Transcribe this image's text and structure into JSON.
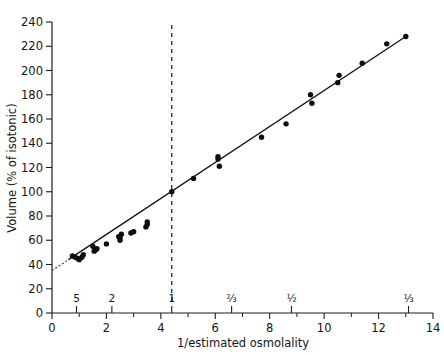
{
  "chart_data": {
    "type": "scatter",
    "title": "",
    "xlabel": "1/estimated osmolality",
    "ylabel": "Volume (% of isotonic)",
    "xlim": [
      0,
      14
    ],
    "ylim": [
      0,
      240
    ],
    "grid": false,
    "legend": null,
    "x_ticks": [
      0,
      2,
      4,
      6,
      8,
      10,
      12,
      14
    ],
    "x_tick_labels": [
      "0",
      "2",
      "4",
      "6",
      "8",
      "10",
      "12",
      "14"
    ],
    "x_minor_ticks": [
      1,
      3,
      5,
      7,
      9,
      11,
      13
    ],
    "y_ticks": [
      0,
      20,
      40,
      60,
      80,
      100,
      120,
      140,
      160,
      180,
      200,
      220,
      240
    ],
    "y_tick_labels": [
      "0",
      "20",
      "40",
      "60",
      "80",
      "100",
      "120",
      "140",
      "160",
      "180",
      "200",
      "220",
      "240"
    ],
    "secondary_axis": {
      "name": "estimated-osmolality",
      "position": "above-x-axis",
      "ticks": [
        0.9,
        2.2,
        4.4,
        6.6,
        8.8,
        13.1
      ],
      "labels": [
        "5",
        "2",
        "1",
        "⅔",
        "½",
        "⅓"
      ]
    },
    "series": [
      {
        "name": "cell volume measurements",
        "type": "scatter",
        "marker": "filled-circle",
        "color": "#0d0d0d",
        "points": [
          [
            0.75,
            47
          ],
          [
            0.85,
            46
          ],
          [
            0.95,
            45
          ],
          [
            1.0,
            44
          ],
          [
            1.1,
            46
          ],
          [
            1.15,
            48
          ],
          [
            1.5,
            55
          ],
          [
            1.55,
            51
          ],
          [
            1.6,
            52
          ],
          [
            1.65,
            53
          ],
          [
            2.0,
            57
          ],
          [
            2.45,
            63
          ],
          [
            2.5,
            62
          ],
          [
            2.5,
            60
          ],
          [
            2.55,
            65
          ],
          [
            2.9,
            66
          ],
          [
            3.0,
            67
          ],
          [
            3.45,
            71
          ],
          [
            3.5,
            73
          ],
          [
            3.5,
            75
          ],
          [
            4.4,
            100
          ],
          [
            5.2,
            111
          ],
          [
            6.1,
            127
          ],
          [
            6.1,
            129
          ],
          [
            6.15,
            121
          ],
          [
            7.7,
            145
          ],
          [
            8.6,
            156
          ],
          [
            9.5,
            180
          ],
          [
            9.55,
            173
          ],
          [
            10.5,
            190
          ],
          [
            10.55,
            196
          ],
          [
            11.4,
            206
          ],
          [
            12.3,
            222
          ],
          [
            13.0,
            228
          ]
        ]
      },
      {
        "name": "regression line",
        "type": "line",
        "color": "#111111",
        "endpoints": [
          [
            0.6,
            44
          ],
          [
            13.0,
            228
          ]
        ],
        "slope": 14.8,
        "intercept": 35.1
      },
      {
        "name": "extrapolated segment",
        "type": "line-dotted",
        "color": "#444444",
        "endpoints": [
          [
            0.0,
            35
          ],
          [
            0.75,
            46
          ]
        ]
      }
    ],
    "annotations": [
      {
        "name": "isotonic-reference-line",
        "type": "vertical-dashed",
        "x": 4.4,
        "y_from": 10,
        "y_to": 240,
        "note": "isotonic reference at 1/osmolality = 4.4, volume = 100%"
      }
    ]
  }
}
